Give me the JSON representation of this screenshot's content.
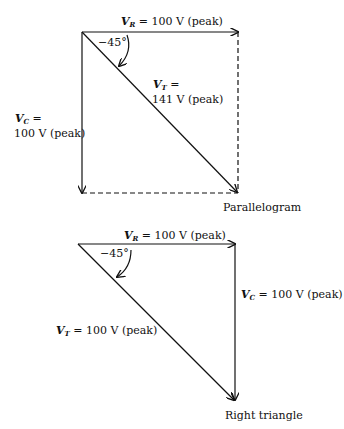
{
  "top_diagram": {
    "caption": "Parallelogram",
    "vr": {
      "sym": "V",
      "sub": "R",
      "text": " = 100 V (peak)"
    },
    "vc": {
      "sym": "V",
      "sub": "C",
      "eq": " =",
      "value": "100 V (peak)"
    },
    "vt": {
      "sym": "V",
      "sub": "T",
      "eq": " =",
      "value": "141 V (peak)"
    },
    "angle": "−45°"
  },
  "bottom_diagram": {
    "caption": "Right triangle",
    "vr": {
      "sym": "V",
      "sub": "R",
      "text": " = 100 V (peak)"
    },
    "vc": {
      "sym": "V",
      "sub": "C",
      "text": " = 100 V (peak)"
    },
    "vt": {
      "sym": "V",
      "sub": "T",
      "text": " = 100 V (peak)"
    },
    "angle": "−45°"
  },
  "colors": {
    "stroke": "#111111",
    "background": "#ffffff"
  }
}
